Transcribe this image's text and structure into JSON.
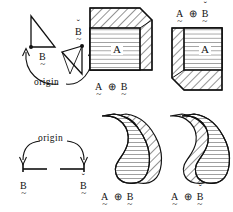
{
  "diagram": {
    "background_color": "#ffffff",
    "ink_color": "#111111",
    "panels": [
      {
        "id": "top-left-structuring-elements",
        "role": "structuring-element-pair",
        "origin_label": "origin",
        "elements": [
          {
            "id": "tri-b",
            "label": "B",
            "accent": "tilde-below",
            "shape": "right-triangle",
            "orientation": "vertical-edge-left"
          },
          {
            "id": "tri-b-check",
            "label": "B",
            "accent": "tilde-below-and-caron-above",
            "shape": "right-triangle",
            "orientation": "vertical-edge-right"
          }
        ]
      },
      {
        "id": "top-middle-dilation",
        "role": "dilation-result",
        "label_position": "below",
        "label": {
          "left": "A",
          "op": "⊕",
          "right": "B",
          "left_accent": "tilde-below",
          "right_accent": "tilde-below"
        },
        "set_label": "A",
        "set_fill": "horizontal-lines",
        "added_region_fill": "diagonal-hatch",
        "added_region_side": "top-right"
      },
      {
        "id": "top-right-dilation",
        "role": "dilation-result",
        "label_position": "above",
        "label": {
          "left": "A",
          "op": "⊕",
          "right": "B",
          "left_accent": "tilde-below",
          "right_accent": "tilde-below-and-caron-above"
        },
        "set_label": "A",
        "set_fill": "horizontal-lines",
        "added_region_fill": "diagonal-hatch",
        "added_region_side": "bottom-left"
      },
      {
        "id": "bottom-left-structuring-elements",
        "role": "structuring-element-pair",
        "origin_label": "origin",
        "elements": [
          {
            "id": "seg-b",
            "label": "B",
            "accent": "tilde-below",
            "shape": "segment",
            "orientation": "origin-at-left"
          },
          {
            "id": "seg-b-check",
            "label": "B",
            "accent": "tilde-below-and-caron-above",
            "shape": "segment",
            "orientation": "origin-at-right"
          }
        ]
      },
      {
        "id": "bottom-middle-dilation",
        "role": "dilation-result",
        "label_position": "below",
        "label": {
          "left": "A",
          "op": "⊕",
          "right": "B",
          "left_accent": "tilde-below",
          "right_accent": "tilde-below"
        },
        "set_fill": "horizontal-lines",
        "added_region_fill": "diagonal-hatch",
        "added_region_side": "right",
        "shape": "kidney"
      },
      {
        "id": "bottom-right-dilation",
        "role": "dilation-result",
        "label_position": "below",
        "label": {
          "left": "A",
          "op": "⊕",
          "right": "B",
          "left_accent": "tilde-below",
          "right_accent": "tilde-below-and-caron-above"
        },
        "set_fill": "horizontal-lines",
        "added_region_fill": "diagonal-hatch",
        "added_region_side": "left",
        "shape": "kidney"
      }
    ]
  },
  "labels": {
    "origin_top": "origin",
    "origin_bottom": "origin",
    "A": "A",
    "B": "B",
    "oplus": "⊕",
    "caron": "ˇ",
    "tilde": "~"
  }
}
